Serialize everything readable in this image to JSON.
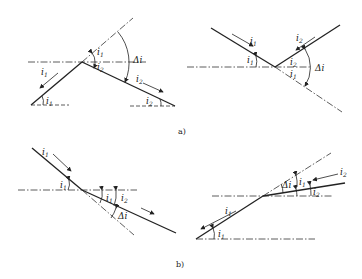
{
  "figure": {
    "captions": {
      "a": "a)",
      "b": "b)"
    },
    "symbols": {
      "i1": "i",
      "i1_sub": "1",
      "i2": "i",
      "i2_sub": "2",
      "delta_i": "Δi"
    },
    "panels": [
      {
        "id": "a-left",
        "description": "incoming link slopes up, outgoing slopes down; Δi between extended i1 and i2"
      },
      {
        "id": "a-right",
        "description": "descending then ascending; Δi between extension and i2"
      },
      {
        "id": "b-left",
        "description": "two descending grades, steeper then gentler; Δi between extension and i2"
      },
      {
        "id": "b-right",
        "description": "two ascending grades, steeper then gentler; Δi between extension and i2"
      }
    ]
  }
}
